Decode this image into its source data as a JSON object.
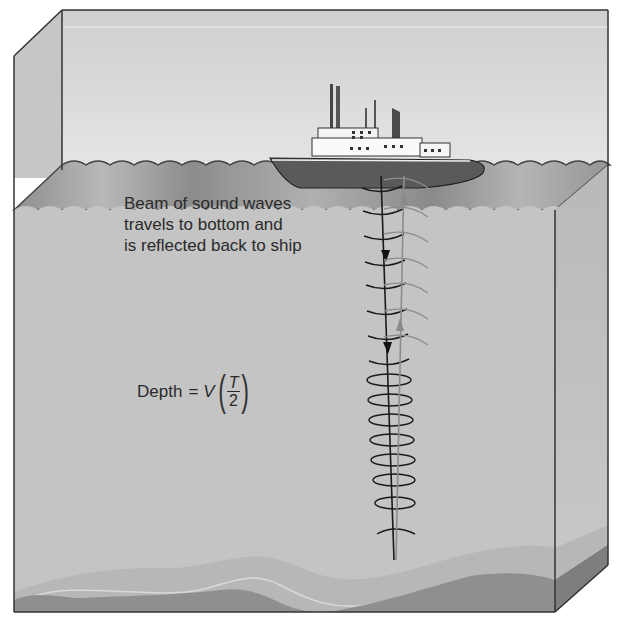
{
  "diagram": {
    "caption_lines": [
      "Beam of sound waves",
      "travels to bottom and",
      "is reflected back to ship"
    ],
    "formula": {
      "lhs": "Depth",
      "equals": "=",
      "variable": "V",
      "numerator": "T",
      "denominator": "2"
    },
    "elements": [
      "ship",
      "water-surface-waves",
      "sound-beam-down",
      "reflected-beam-up",
      "sea-floor",
      "sediment-layer"
    ],
    "colors": {
      "air": "#d9d9d9",
      "water": "#c4c4c4",
      "surface_band": "#9e9e9e",
      "sediment": "#b3b3b3",
      "seafloor": "#8a8a8a",
      "hull": "#5a5a5a",
      "beam_down": "#1a1a1a",
      "beam_up": "#8c8c8c"
    }
  }
}
